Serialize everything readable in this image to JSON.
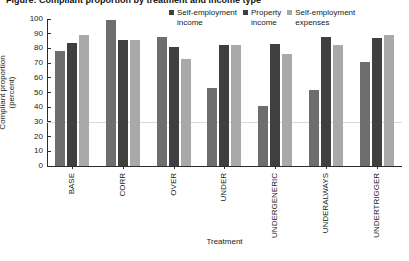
{
  "figure": {
    "clipped_title": "Figure: Compliant proportion by treatment and income type",
    "xlabel": "Treatment",
    "ylabel_line1": "Compliant proportion",
    "ylabel_line2": "(percent)"
  },
  "legend": {
    "items": [
      {
        "label_line1": "Self-employment",
        "label_line2": "income",
        "color": "#3f3f3f",
        "swatch": "legend-swatch-icon"
      },
      {
        "label_line1": "Property",
        "label_line2": "income",
        "color": "#3f3f3f",
        "swatch": "legend-swatch-icon"
      },
      {
        "label_line1": "Self-employment",
        "label_line2": "expenses",
        "color": "#a9a9a9",
        "swatch": "legend-swatch-icon"
      }
    ]
  },
  "chart_data": {
    "type": "bar",
    "title": "Compliant proportion by treatment",
    "xlabel": "Treatment",
    "ylabel": "Compliant proportion (percent)",
    "ylim": [
      0,
      100
    ],
    "yticks": [
      0,
      10,
      20,
      30,
      40,
      50,
      60,
      70,
      80,
      90,
      100
    ],
    "ytick_labels": [
      "0",
      "10",
      "20",
      "30",
      "40",
      "50",
      "60",
      "70",
      "80",
      "90",
      "100"
    ],
    "grid": "single horizontal gridline near 30",
    "gridline_values": [
      30
    ],
    "legend_position": "top-right",
    "categories": [
      "BASE",
      "CORR",
      "OVER",
      "UNDER",
      "UNDERGENERIC",
      "UNDERALWAYS",
      "UNDERTRIGGER"
    ],
    "series": [
      {
        "name": "Self-employment income",
        "color": "#6e6e6e",
        "values": [
          78,
          99,
          88,
          53,
          41,
          52,
          71
        ]
      },
      {
        "name": "Property income",
        "color": "#3f3f3f",
        "values": [
          84,
          86,
          81,
          82,
          83,
          88,
          87
        ]
      },
      {
        "name": "Self-employment expenses",
        "color": "#a9a9a9",
        "values": [
          89,
          86,
          73,
          82,
          76,
          82,
          89
        ]
      }
    ]
  }
}
